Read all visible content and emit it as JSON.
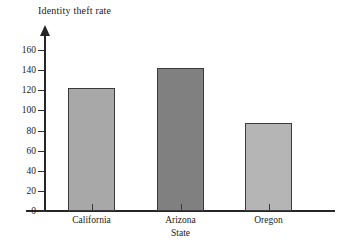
{
  "chart_data": {
    "type": "bar",
    "title": "Identity theft rate",
    "xlabel": "State",
    "ylabel": "",
    "categories": [
      "California",
      "Arizona",
      "Oregon"
    ],
    "values": [
      122,
      142,
      87
    ],
    "series": [
      {
        "name": "Identity theft rate",
        "values": [
          122,
          142,
          87
        ]
      }
    ],
    "ylim": [
      0,
      170
    ],
    "y_ticks": [
      0,
      20,
      40,
      60,
      80,
      100,
      120,
      140,
      160
    ],
    "y_tick_labels": [
      "0",
      "20",
      "40",
      "60",
      "80",
      "100",
      "120",
      "140",
      "160"
    ],
    "grid": false,
    "legend": false,
    "legend_position": "none",
    "bar_colors": [
      "#a8a8a8",
      "#808080",
      "#b5b5b5"
    ],
    "bar_edge_color": "#3a3a3a",
    "axis_color": "#262626",
    "background_color": "#ffffff",
    "y_axis_arrow": true,
    "bars": [
      {
        "label": "California",
        "value": 122,
        "color": "#a8a8a8"
      },
      {
        "label": "Arizona",
        "value": 142,
        "color": "#808080"
      },
      {
        "label": "Oregon",
        "value": 87,
        "color": "#b5b5b5"
      }
    ]
  }
}
